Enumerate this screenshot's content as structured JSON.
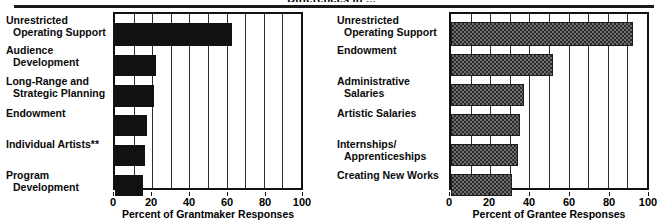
{
  "figure": {
    "cropped_title": "Differences in ..."
  },
  "chart_data": [
    {
      "type": "bar",
      "orientation": "horizontal",
      "panel": "left",
      "title": "",
      "xlabel": "Percent of Grantmaker Responses",
      "ylabel": "",
      "xlim": [
        0,
        100
      ],
      "xticks": [
        0,
        20,
        40,
        60,
        80,
        100
      ],
      "gridlines_every": 10,
      "grid": true,
      "legend": "none",
      "bar_style": "solid-black",
      "bar_color": "#111111",
      "categories": [
        "Unrestricted\nOperating Support",
        "Audience\nDevelopment",
        "Long-Range and\nStrategic Planning",
        "Endowment",
        "Individual Artists**",
        "Program\nDevelopment"
      ],
      "values": [
        63,
        22,
        21,
        17,
        16,
        15
      ]
    },
    {
      "type": "bar",
      "orientation": "horizontal",
      "panel": "right",
      "title": "",
      "xlabel": "Percent of Grantee Responses",
      "ylabel": "",
      "xlim": [
        0,
        100
      ],
      "xticks": [
        0,
        20,
        40,
        60,
        80,
        100
      ],
      "gridlines_every": 10,
      "grid": true,
      "legend": "none",
      "bar_style": "hatched-gray",
      "bar_color": "#6f6f6f",
      "categories": [
        "Unrestricted\nOperating Support",
        "Endowment",
        "Administrative\nSalaries",
        "Artistic Salaries",
        "Internships/\nApprenticeships",
        "Creating New Works"
      ],
      "values": [
        93,
        52,
        37,
        35,
        34,
        31
      ]
    }
  ]
}
